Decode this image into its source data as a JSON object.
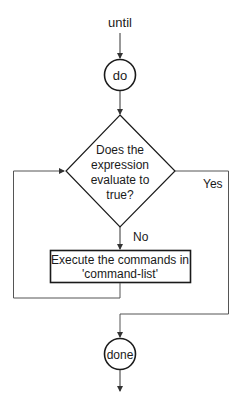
{
  "diagram": {
    "type": "flowchart",
    "entry_label": "until",
    "start_node": "do",
    "decision": {
      "lines": [
        "Does the",
        "expression",
        "evaluate to",
        "true?"
      ]
    },
    "yes_label": "Yes",
    "no_label": "No",
    "process": {
      "lines": [
        "Execute the commands in",
        "'command-list'"
      ]
    },
    "end_node": "done"
  },
  "colors": {
    "stroke": "#1a1a1a",
    "connector": "#555555",
    "background": "#ffffff"
  }
}
